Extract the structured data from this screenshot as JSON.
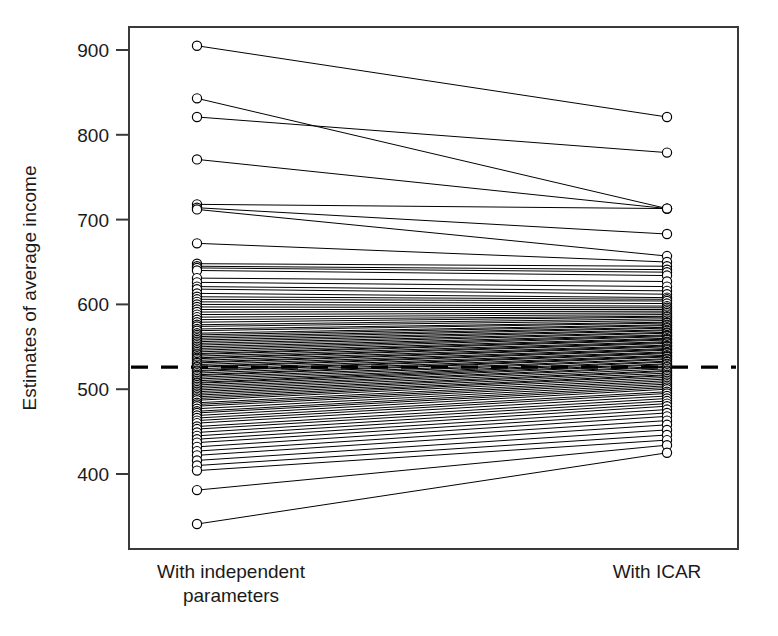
{
  "chart_data": {
    "type": "line",
    "chart_style": "slopegraph-parallel-coordinates",
    "title": "",
    "xlabel": "",
    "ylabel": "Estimates of average income",
    "categories": [
      "With independent parameters",
      "With ICAR"
    ],
    "category_labels_wrapped": [
      [
        "With independent",
        "parameters"
      ],
      [
        "With ICAR"
      ]
    ],
    "ylim": [
      330,
      925
    ],
    "yticks": [
      400,
      500,
      600,
      700,
      800,
      900
    ],
    "ytick_labels": [
      "400",
      "500",
      "600",
      "700",
      "800",
      "900"
    ],
    "grid": false,
    "legend": null,
    "reference_line": {
      "value": 526,
      "style": "dashed",
      "orientation": "horizontal",
      "label": ""
    },
    "marker": "open-circle",
    "n_pairs": 100,
    "series_note": "Each line connects one area's income estimate under independent parameters (left) to its estimate under the ICAR model (right).",
    "pairs": [
      [
        905,
        821
      ],
      [
        843,
        713
      ],
      [
        821,
        779
      ],
      [
        771,
        713
      ],
      [
        718,
        713
      ],
      [
        714,
        683
      ],
      [
        712,
        657
      ],
      [
        672,
        650
      ],
      [
        648,
        645
      ],
      [
        645,
        641
      ],
      [
        643,
        638
      ],
      [
        640,
        634
      ],
      [
        631,
        627
      ],
      [
        626,
        621
      ],
      [
        621,
        616
      ],
      [
        618,
        612
      ],
      [
        613,
        608
      ],
      [
        609,
        606
      ],
      [
        606,
        604
      ],
      [
        603,
        601
      ],
      [
        600,
        598
      ],
      [
        597,
        596
      ],
      [
        594,
        594
      ],
      [
        591,
        592
      ],
      [
        588,
        590
      ],
      [
        585,
        588
      ],
      [
        582,
        586
      ],
      [
        579,
        585
      ],
      [
        576,
        583
      ],
      [
        574,
        581
      ],
      [
        571,
        579
      ],
      [
        569,
        578
      ],
      [
        566,
        576
      ],
      [
        564,
        575
      ],
      [
        562,
        573
      ],
      [
        560,
        572
      ],
      [
        558,
        570
      ],
      [
        556,
        569
      ],
      [
        554,
        567
      ],
      [
        552,
        566
      ],
      [
        550,
        564
      ],
      [
        548,
        563
      ],
      [
        546,
        562
      ],
      [
        544,
        560
      ],
      [
        542,
        559
      ],
      [
        541,
        558
      ],
      [
        539,
        556
      ],
      [
        537,
        555
      ],
      [
        536,
        554
      ],
      [
        534,
        552
      ],
      [
        532,
        551
      ],
      [
        531,
        550
      ],
      [
        529,
        548
      ],
      [
        527,
        547
      ],
      [
        526,
        546
      ],
      [
        524,
        544
      ],
      [
        522,
        543
      ],
      [
        521,
        542
      ],
      [
        519,
        540
      ],
      [
        517,
        539
      ],
      [
        516,
        538
      ],
      [
        514,
        536
      ],
      [
        512,
        535
      ],
      [
        510,
        533
      ],
      [
        508,
        532
      ],
      [
        507,
        530
      ],
      [
        505,
        529
      ],
      [
        503,
        527
      ],
      [
        501,
        526
      ],
      [
        499,
        524
      ],
      [
        497,
        522
      ],
      [
        495,
        521
      ],
      [
        493,
        519
      ],
      [
        491,
        517
      ],
      [
        489,
        516
      ],
      [
        487,
        514
      ],
      [
        484,
        512
      ],
      [
        482,
        510
      ],
      [
        480,
        508
      ],
      [
        477,
        506
      ],
      [
        474,
        504
      ],
      [
        472,
        502
      ],
      [
        469,
        500
      ],
      [
        466,
        497
      ],
      [
        463,
        495
      ],
      [
        460,
        492
      ],
      [
        456,
        489
      ],
      [
        453,
        486
      ],
      [
        449,
        483
      ],
      [
        445,
        480
      ],
      [
        441,
        476
      ],
      [
        437,
        472
      ],
      [
        432,
        468
      ],
      [
        427,
        463
      ],
      [
        422,
        458
      ],
      [
        416,
        452
      ],
      [
        410,
        446
      ],
      [
        404,
        440
      ],
      [
        381,
        434
      ],
      [
        341,
        425
      ]
    ]
  },
  "axis": {
    "ylabel": "Estimates of average income",
    "left_group_line1": "With independent",
    "left_group_line2": "parameters",
    "right_group": "With ICAR"
  },
  "colors": {
    "line": "#000000",
    "frame": "#3a3a3a",
    "marker_fill": "#ffffff",
    "reference": "#000000",
    "background": "#ffffff",
    "text": "#1a1a1a"
  }
}
